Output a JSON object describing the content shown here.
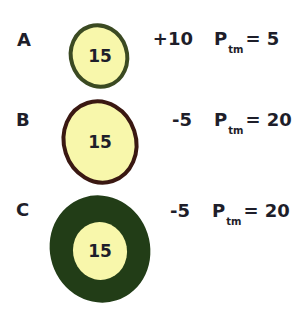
{
  "rows": [
    {
      "label": "A",
      "value": "15",
      "delta": "+10",
      "p_symbol": "P",
      "p_subscript": "tm",
      "p_equals": "= 5",
      "colors": {
        "fill": "#f8f7ab",
        "border": "#3b4a22"
      }
    },
    {
      "label": "B",
      "value": "15",
      "delta": "-5",
      "p_symbol": "P",
      "p_subscript": "tm",
      "p_equals": "= 20",
      "colors": {
        "fill": "#f8f7ab",
        "border": "#3a1812"
      }
    },
    {
      "label": "C",
      "value": "15",
      "delta": "-5",
      "p_symbol": "P",
      "p_subscript": "tm",
      "p_equals": "= 20",
      "colors": {
        "fill": "#f8f7ab",
        "border": "#223d17"
      }
    }
  ]
}
